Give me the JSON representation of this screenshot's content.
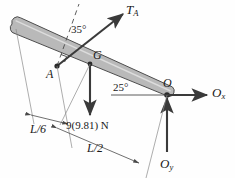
{
  "figure": {
    "type": "free-body-diagram",
    "background_color": "#fefefe",
    "bar": {
      "name": "uniform-bar",
      "fill_color": "#b5b5b5",
      "stroke_color": "#4a4a4a",
      "end_left_label": "",
      "end_right_label": "O"
    },
    "points": {
      "a": {
        "label": "A",
        "x": 57,
        "y": 66
      },
      "g": {
        "label": "G",
        "x": 95,
        "y": 55
      },
      "o": {
        "label": "O",
        "x": 170,
        "y": 90
      }
    },
    "forces": [
      {
        "name": "tension-TA",
        "label": "T",
        "sub": "A",
        "color": "#3a3a3a",
        "direction": "up-right"
      },
      {
        "name": "weight",
        "label": "9(9.81) N",
        "color": "#3a3a3a",
        "direction": "down"
      },
      {
        "name": "reaction-Ox",
        "label": "O",
        "sub": "x",
        "color": "#3a3a3a",
        "direction": "right"
      },
      {
        "name": "reaction-Oy",
        "label": "O",
        "sub": "y",
        "color": "#3a3a3a",
        "direction": "up"
      }
    ],
    "angles": [
      {
        "name": "angle-35",
        "label": "35°",
        "value": 35,
        "at": "A",
        "between": "dashed-perpendicular and TA"
      },
      {
        "name": "angle-25",
        "label": "25°",
        "value": 25,
        "at": "O",
        "between": "horizontal reference and bar"
      }
    ],
    "dimensions": [
      {
        "name": "dimension-L6",
        "label": "L/6",
        "numerator": "L",
        "denominator": "6"
      },
      {
        "name": "dimension-L2",
        "label": "L/2",
        "numerator": "L",
        "denominator": "2"
      }
    ],
    "markers": [
      {
        "name": "right-angle-marker",
        "at": "A"
      }
    ]
  }
}
